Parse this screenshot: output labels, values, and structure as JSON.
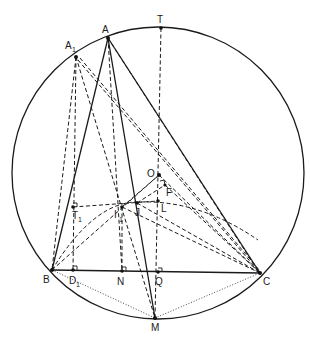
{
  "diagram": {
    "type": "geometry-construction",
    "circle": {
      "cx": 158,
      "cy": 173,
      "r": 146
    },
    "points": {
      "A": {
        "label": "A",
        "sub": "",
        "x": 108,
        "y": 38
      },
      "A1": {
        "label": "A",
        "sub": "1",
        "x": 76,
        "y": 57
      },
      "T": {
        "label": "T",
        "sub": "",
        "x": 161,
        "y": 28
      },
      "B": {
        "label": "B",
        "sub": "",
        "x": 52,
        "y": 270
      },
      "C": {
        "label": "C",
        "sub": "",
        "x": 260,
        "y": 273
      },
      "M": {
        "label": "M",
        "sub": "",
        "x": 155,
        "y": 318
      },
      "D1": {
        "label": "D",
        "sub": "1",
        "x": 73,
        "y": 270
      },
      "N": {
        "label": "N",
        "sub": "",
        "x": 122,
        "y": 271
      },
      "Q": {
        "label": "Q",
        "sub": "",
        "x": 158,
        "y": 272
      },
      "O": {
        "label": "O",
        "sub": "",
        "x": 159,
        "y": 175
      },
      "F": {
        "label": "F",
        "sub": "",
        "x": 165,
        "y": 185
      },
      "L": {
        "label": "L",
        "sub": "",
        "x": 158,
        "y": 201
      },
      "J": {
        "label": "J",
        "sub": "",
        "x": 137,
        "y": 203
      },
      "I1": {
        "label": "I",
        "sub": "1",
        "x": 122,
        "y": 207
      },
      "T1": {
        "label": "T",
        "sub": "1",
        "x": 73,
        "y": 207
      }
    },
    "labels": {
      "A": "A",
      "A1": "A",
      "A1_sub": "1",
      "T": "T",
      "B": "B",
      "C": "C",
      "M": "M",
      "D1": "D",
      "D1_sub": "1",
      "N": "N",
      "Q": "Q",
      "O": "O",
      "F": "F",
      "L": "L",
      "J": "J",
      "I1": "I",
      "I1_sub": "1",
      "T1": "T",
      "T1_sub": "1"
    },
    "solid_segments": [
      [
        "A",
        "B"
      ],
      [
        "A",
        "C"
      ],
      [
        "B",
        "C"
      ],
      [
        "A",
        "M"
      ]
    ],
    "dashed_segments": [
      [
        "T",
        "M"
      ],
      [
        "A1",
        "B"
      ],
      [
        "A1",
        "D1"
      ],
      [
        "A1",
        "C"
      ],
      [
        "A1",
        "M"
      ],
      [
        "A1",
        "O"
      ],
      [
        "A",
        "C_inner"
      ],
      [
        "A",
        "N"
      ],
      [
        "T1",
        "L"
      ],
      [
        "I1",
        "N"
      ],
      [
        "B",
        "O"
      ],
      [
        "J",
        "C"
      ],
      [
        "I1",
        "C"
      ],
      [
        "O",
        "C"
      ],
      [
        "F",
        "C"
      ]
    ],
    "dotted_segments": [
      [
        "B",
        "M"
      ],
      [
        "M",
        "C"
      ]
    ],
    "right_angle_marks": [
      "D1",
      "N",
      "Q",
      "T1",
      "F"
    ]
  }
}
